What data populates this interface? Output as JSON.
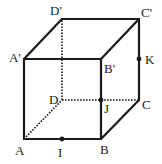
{
  "diagram": {
    "type": "cube",
    "vertices": {
      "A": {
        "label": "A",
        "x": 24,
        "y": 139
      },
      "B": {
        "label": "B",
        "x": 101,
        "y": 139
      },
      "C": {
        "label": "C",
        "x": 139,
        "y": 100
      },
      "D": {
        "label": "D",
        "x": 62,
        "y": 100
      },
      "A'": {
        "label": "A'",
        "x": 24,
        "y": 59
      },
      "B'": {
        "label": "B'",
        "x": 101,
        "y": 59
      },
      "C'": {
        "label": "C'",
        "x": 139,
        "y": 19
      },
      "D'": {
        "label": "D'",
        "x": 62,
        "y": 19
      }
    },
    "points": {
      "I": {
        "label": "I",
        "x": 62,
        "y": 139,
        "on": "AB"
      },
      "J": {
        "label": "J",
        "x": 101,
        "y": 100,
        "on": "BB'"
      },
      "K": {
        "label": "K",
        "x": 139,
        "y": 59,
        "on": "CC'"
      }
    },
    "visible_edges": [
      "AB",
      "BC",
      "CC'",
      "C'D'",
      "D'A'",
      "A'A",
      "A'B'",
      "B'B",
      "B'C'"
    ],
    "hidden_edges": [
      "AD",
      "DC",
      "DD'"
    ]
  }
}
